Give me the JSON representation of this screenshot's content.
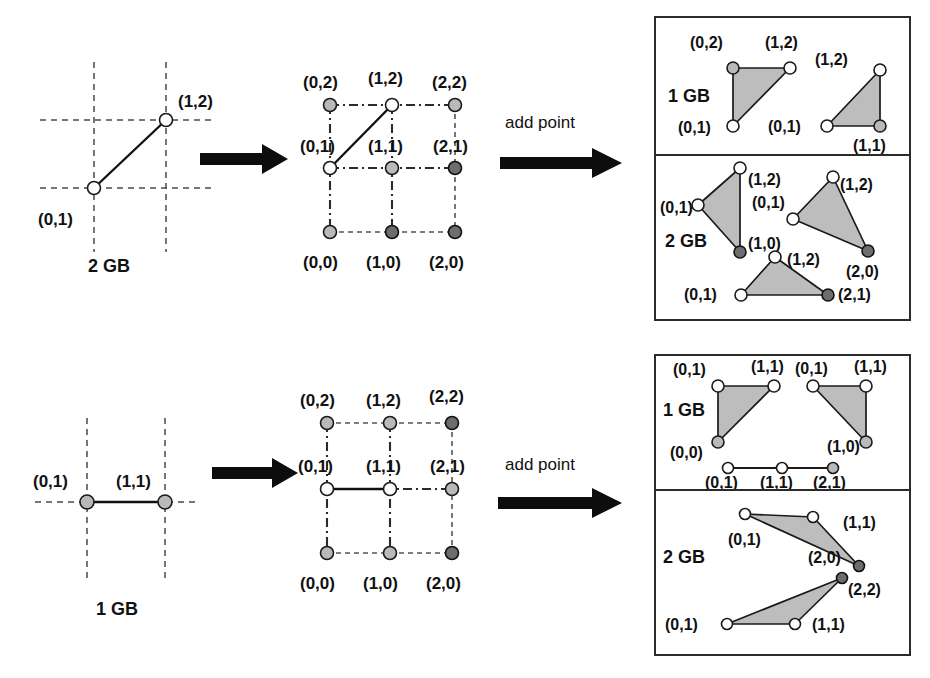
{
  "figure": {
    "width": 930,
    "height": 678,
    "colors": {
      "triangle_fill": "#bdbdbd",
      "node_white": "#fdfdfd",
      "node_light_gray": "#b9b9b9",
      "node_dark_gray": "#6d6d6d",
      "line": "#1a1a1a",
      "panel_border": "#2b2b2b"
    }
  },
  "rows": [
    {
      "id": "row-top",
      "left_panel": {
        "caption": "2 GB",
        "points": [
          {
            "label": "(0,1)",
            "x": 0,
            "y": 1,
            "style": "white"
          },
          {
            "label": "(1,2)",
            "x": 1,
            "y": 2,
            "style": "white"
          }
        ],
        "segment": {
          "from": "(0,1)",
          "to": "(1,2)"
        }
      },
      "arrow_label": "",
      "middle_panel": {
        "grid_points": [
          {
            "label": "(0,2)",
            "style": "light"
          },
          {
            "label": "(1,2)",
            "style": "white"
          },
          {
            "label": "(2,2)",
            "style": "light"
          },
          {
            "label": "(0,1)",
            "style": "white"
          },
          {
            "label": "(1,1)",
            "style": "light"
          },
          {
            "label": "(2,1)",
            "style": "dark"
          },
          {
            "label": "(0,0)",
            "style": "light"
          },
          {
            "label": "(1,0)",
            "style": "dark"
          },
          {
            "label": "(2,0)",
            "style": "dark"
          }
        ],
        "segment": {
          "from": "(0,1)",
          "to": "(1,2)"
        }
      },
      "transition_label": "add point",
      "result_panels": [
        {
          "caption": "1 GB",
          "shapes": [
            {
              "type": "triangle",
              "vertices": [
                {
                  "label": "(0,2)",
                  "style": "light"
                },
                {
                  "label": "(1,2)",
                  "style": "white"
                },
                {
                  "label": "(0,1)",
                  "style": "white"
                }
              ]
            },
            {
              "type": "triangle",
              "vertices": [
                {
                  "label": "(1,2)",
                  "style": "white"
                },
                {
                  "label": "(1,1)",
                  "style": "light"
                },
                {
                  "label": "(0,1)",
                  "style": "white"
                }
              ]
            }
          ]
        },
        {
          "caption": "2 GB",
          "shapes": [
            {
              "type": "triangle",
              "vertices": [
                {
                  "label": "(1,2)",
                  "style": "white"
                },
                {
                  "label": "(0,1)",
                  "style": "white"
                },
                {
                  "label": "(1,0)",
                  "style": "dark"
                }
              ]
            },
            {
              "type": "triangle",
              "vertices": [
                {
                  "label": "(1,2)",
                  "style": "white"
                },
                {
                  "label": "(0,1)",
                  "style": "white"
                },
                {
                  "label": "(2,0)",
                  "style": "dark"
                }
              ]
            },
            {
              "type": "triangle",
              "vertices": [
                {
                  "label": "(1,2)",
                  "style": "white"
                },
                {
                  "label": "(0,1)",
                  "style": "white"
                },
                {
                  "label": "(2,1)",
                  "style": "dark"
                }
              ]
            }
          ]
        }
      ]
    },
    {
      "id": "row-bottom",
      "left_panel": {
        "caption": "1 GB",
        "points": [
          {
            "label": "(0,1)",
            "x": 0,
            "y": 1,
            "style": "light"
          },
          {
            "label": "(1,1)",
            "x": 1,
            "y": 1,
            "style": "light"
          }
        ],
        "segment": {
          "from": "(0,1)",
          "to": "(1,1)"
        }
      },
      "middle_panel": {
        "grid_points": [
          {
            "label": "(0,2)",
            "style": "light"
          },
          {
            "label": "(1,2)",
            "style": "light"
          },
          {
            "label": "(2,2)",
            "style": "dark"
          },
          {
            "label": "(0,1)",
            "style": "white"
          },
          {
            "label": "(1,1)",
            "style": "white"
          },
          {
            "label": "(2,1)",
            "style": "light"
          },
          {
            "label": "(0,0)",
            "style": "light"
          },
          {
            "label": "(1,0)",
            "style": "light"
          },
          {
            "label": "(2,0)",
            "style": "dark"
          }
        ],
        "segment": {
          "from": "(0,1)",
          "to": "(1,1)"
        }
      },
      "transition_label": "add point",
      "result_panels": [
        {
          "caption": "1 GB",
          "shapes": [
            {
              "type": "triangle",
              "vertices": [
                {
                  "label": "(0,1)",
                  "style": "white"
                },
                {
                  "label": "(1,1)",
                  "style": "white"
                },
                {
                  "label": "(0,0)",
                  "style": "light"
                }
              ]
            },
            {
              "type": "triangle",
              "vertices": [
                {
                  "label": "(0,1)",
                  "style": "white"
                },
                {
                  "label": "(1,1)",
                  "style": "white"
                },
                {
                  "label": "(1,0)",
                  "style": "light"
                }
              ]
            },
            {
              "type": "segment",
              "vertices": [
                {
                  "label": "(0,1)",
                  "style": "white"
                },
                {
                  "label": "(1,1)",
                  "style": "white"
                },
                {
                  "label": "(2,1)",
                  "style": "light"
                }
              ]
            }
          ]
        },
        {
          "caption": "2 GB",
          "shapes": [
            {
              "type": "triangle",
              "vertices": [
                {
                  "label": "(0,1)",
                  "style": "white"
                },
                {
                  "label": "(1,1)",
                  "style": "white"
                },
                {
                  "label": "(2,0)",
                  "style": "dark"
                }
              ]
            },
            {
              "type": "triangle",
              "vertices": [
                {
                  "label": "(0,1)",
                  "style": "white"
                },
                {
                  "label": "(1,1)",
                  "style": "white"
                },
                {
                  "label": "(2,2)",
                  "style": "dark"
                }
              ]
            }
          ]
        }
      ]
    }
  ],
  "labels": {
    "add_point": "add point",
    "gb1": "1 GB",
    "gb2": "2 GB",
    "p00": "(0,0)",
    "p10": "(1,0)",
    "p20": "(2,0)",
    "p01": "(0,1)",
    "p11": "(1,1)",
    "p21": "(2,1)",
    "p02": "(0,2)",
    "p12": "(1,2)",
    "p22": "(2,2)"
  }
}
